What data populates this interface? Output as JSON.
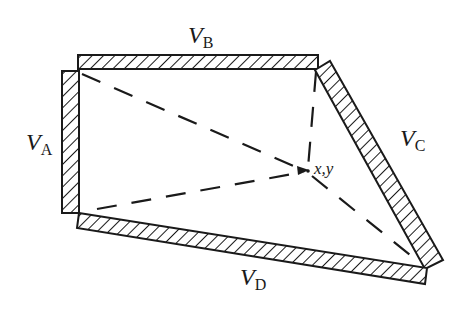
{
  "diagram": {
    "type": "quadrilateral electrode region with dashed lines to interior point",
    "colors": {
      "ink": "#1a1a1a",
      "background": "#ffffff"
    },
    "electrodes": [
      {
        "id": "A",
        "symbol": "V",
        "subscript": "A",
        "side": "left"
      },
      {
        "id": "B",
        "symbol": "V",
        "subscript": "B",
        "side": "top"
      },
      {
        "id": "C",
        "symbol": "V",
        "subscript": "C",
        "side": "right (slanted)"
      },
      {
        "id": "D",
        "symbol": "V",
        "subscript": "D",
        "side": "bottom (slanted)"
      }
    ],
    "point": {
      "label": "x,y"
    },
    "dashed_lines": [
      {
        "from": "top-left corner (A/B)",
        "to": "point"
      },
      {
        "from": "top-right corner (B/C)",
        "to": "point"
      },
      {
        "from": "bottom-left corner (A/D)",
        "to": "point"
      },
      {
        "from": "bottom-right corner (C/D)",
        "to": "point"
      }
    ]
  }
}
